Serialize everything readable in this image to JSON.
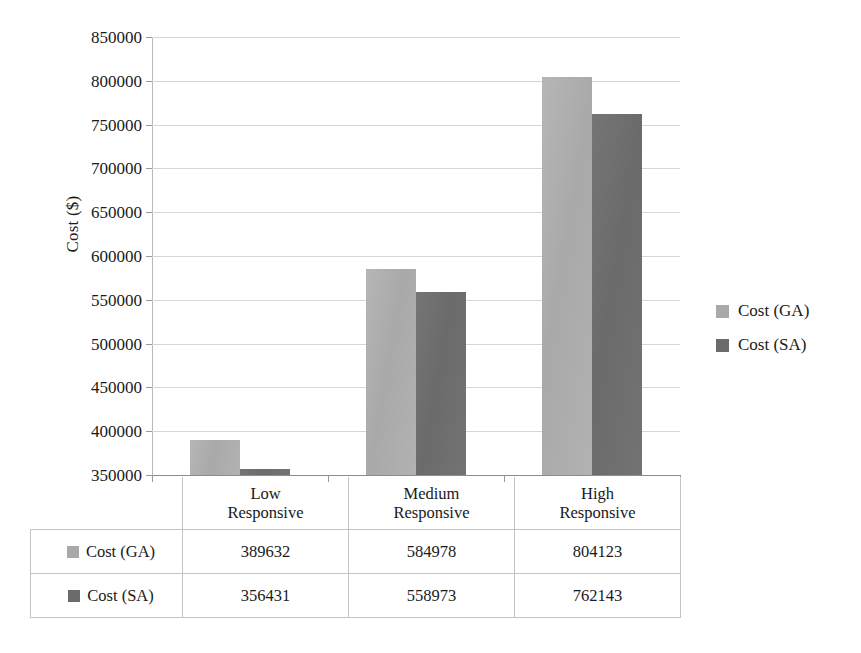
{
  "chart_data": {
    "type": "bar",
    "title": "",
    "subtitle": "",
    "xlabel": "",
    "ylabel": "Cost ($)",
    "categories": [
      "Low Responsive",
      "Medium Responsive",
      "High Responsive"
    ],
    "category_lines": [
      [
        "Low",
        "Responsive"
      ],
      [
        "Medium",
        "Responsive"
      ],
      [
        "High",
        "Responsive"
      ]
    ],
    "series": [
      {
        "name": "Cost (GA)",
        "values": [
          389632,
          584978,
          804123
        ],
        "color": "#a9a9a9"
      },
      {
        "name": "Cost (SA)",
        "values": [
          356431,
          558973,
          762143
        ],
        "color": "#6b6b6b"
      }
    ],
    "ylim": [
      350000,
      850000
    ],
    "ytick_step": 50000,
    "ytick_labels": [
      "850000",
      "800000",
      "750000",
      "700000",
      "650000",
      "600000",
      "550000",
      "500000",
      "450000",
      "400000",
      "350000"
    ],
    "ytick_values": [
      850000,
      800000,
      750000,
      700000,
      650000,
      600000,
      550000,
      500000,
      450000,
      400000,
      350000
    ],
    "grid": true,
    "legend_position": "right",
    "data_table_visible": true
  },
  "legend": {
    "entries": [
      {
        "label": "Cost (GA)",
        "swatch": "ga"
      },
      {
        "label": "Cost (SA)",
        "swatch": "sa"
      }
    ]
  },
  "data_table": {
    "column_headers": [
      "",
      "Low Responsive",
      "Medium Responsive",
      "High Responsive"
    ],
    "rows": [
      {
        "series": "Cost (GA)",
        "swatch": "ga",
        "values": [
          "389632",
          "584978",
          "804123"
        ]
      },
      {
        "series": "Cost (SA)",
        "swatch": "sa",
        "values": [
          "356431",
          "558973",
          "762143"
        ]
      }
    ]
  }
}
